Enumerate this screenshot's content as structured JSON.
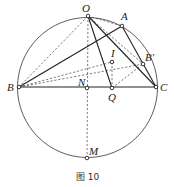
{
  "figure": {
    "caption": "图 10",
    "circle": {
      "cx": 87.5,
      "cy": 87.5,
      "r": 70
    },
    "points": {
      "O": {
        "x": 88,
        "y": 16,
        "label": "O"
      },
      "A": {
        "x": 122,
        "y": 26,
        "label": "A"
      },
      "B": {
        "x": 19,
        "y": 87,
        "label": "B"
      },
      "C": {
        "x": 156,
        "y": 87,
        "label": "C"
      },
      "B_prime": {
        "x": 143,
        "y": 64,
        "label": "B'"
      },
      "N": {
        "x": 87,
        "y": 88,
        "label": "N"
      },
      "Q": {
        "x": 112,
        "y": 88,
        "label": "Q"
      },
      "I": {
        "x": 112,
        "y": 62,
        "label": "I"
      },
      "M": {
        "x": 87,
        "y": 158,
        "label": "M"
      }
    },
    "solid_segments": [
      [
        "B",
        "C"
      ],
      [
        "B",
        "A"
      ],
      [
        "O",
        "Q"
      ],
      [
        "O",
        "C"
      ],
      [
        "A",
        "C"
      ]
    ],
    "dashed_segments": [
      [
        "B",
        "O"
      ],
      [
        "B",
        "I"
      ],
      [
        "B",
        "B_prime"
      ],
      [
        "O",
        "A"
      ],
      [
        "O",
        "B_prime"
      ],
      [
        "O",
        "M"
      ],
      [
        "I",
        "Q"
      ],
      [
        "Q",
        "B_prime"
      ]
    ]
  }
}
